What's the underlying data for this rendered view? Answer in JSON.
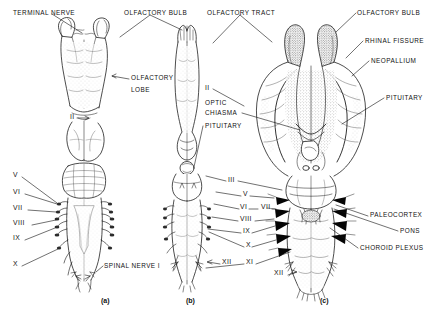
{
  "figure": {
    "background_color": "#ffffff",
    "ink_color": "#111111",
    "width": 429,
    "height": 319
  },
  "panels": [
    {
      "id": "a",
      "caption": "(a)",
      "x": 101,
      "y": 301
    },
    {
      "id": "b",
      "caption": "(b)",
      "x": 186,
      "y": 301
    },
    {
      "id": "c",
      "caption": "(c)",
      "x": 320,
      "y": 301
    }
  ],
  "labels": {
    "terminal_nerve": {
      "text": "TERMINAL NERVE",
      "x": 13,
      "y": 9
    },
    "olfactory_bulb_left": {
      "text": "OLFACTORY BULB",
      "x": 124,
      "y": 9
    },
    "olfactory_tract": {
      "text": "OLFACTORY TRACT",
      "x": 207,
      "y": 9
    },
    "olfactory_bulb_right": {
      "text": "OLFACTORY BULB",
      "x": 357,
      "y": 9
    },
    "rhinal_fissure": {
      "text": "RHINAL FISSURE",
      "x": 365,
      "y": 37
    },
    "neopallium": {
      "text": "NEOPALLIUM",
      "x": 371,
      "y": 57
    },
    "pituitary_right": {
      "text": "PITUITARY",
      "x": 386,
      "y": 94
    },
    "olfactory_lobe_line1": {
      "text": "OLFACTORY",
      "x": 131,
      "y": 78
    },
    "olfactory_lobe_line2": {
      "text": "LOBE",
      "x": 131,
      "y": 89
    },
    "optic_chiasma_line1": {
      "text": "OPTIC",
      "x": 205,
      "y": 102
    },
    "optic_chiasma_line2": {
      "text": "CHIASMA",
      "x": 205,
      "y": 112
    },
    "pituitary_mid": {
      "text": "PITUITARY",
      "x": 205,
      "y": 124
    },
    "spinal_nerve_1": {
      "text": "SPINAL NERVE I",
      "x": 104,
      "y": 264
    },
    "paleocortex": {
      "text": "PALEOCORTEX",
      "x": 370,
      "y": 213
    },
    "pons": {
      "text": "PONS",
      "x": 400,
      "y": 229
    },
    "choroid_plexus": {
      "text": "CHOROID PLEXUS",
      "x": 360,
      "y": 246
    }
  },
  "roman_numerals": {
    "panel_a": [
      {
        "text": "II",
        "x": 70,
        "y": 117
      },
      {
        "text": "V",
        "x": 13,
        "y": 175
      },
      {
        "text": "VI",
        "x": 13,
        "y": 192
      },
      {
        "text": "VII",
        "x": 13,
        "y": 208
      },
      {
        "text": "VIII",
        "x": 13,
        "y": 223
      },
      {
        "text": "IX",
        "x": 13,
        "y": 238
      },
      {
        "text": "X",
        "x": 13,
        "y": 264
      }
    ],
    "panel_b": [
      {
        "text": "II",
        "x": 205,
        "y": 88
      },
      {
        "text": "III",
        "x": 228,
        "y": 179
      },
      {
        "text": "XII",
        "x": 222,
        "y": 262
      }
    ],
    "panel_c": [
      {
        "text": "V",
        "x": 243,
        "y": 194
      },
      {
        "text": "VI",
        "x": 240,
        "y": 207
      },
      {
        "text": "VII",
        "x": 261,
        "y": 207
      },
      {
        "text": "VIII",
        "x": 240,
        "y": 219
      },
      {
        "text": "IX",
        "x": 243,
        "y": 231
      },
      {
        "text": "X",
        "x": 246,
        "y": 245
      },
      {
        "text": "XI",
        "x": 246,
        "y": 262
      },
      {
        "text": "XII",
        "x": 274,
        "y": 273
      }
    ]
  }
}
